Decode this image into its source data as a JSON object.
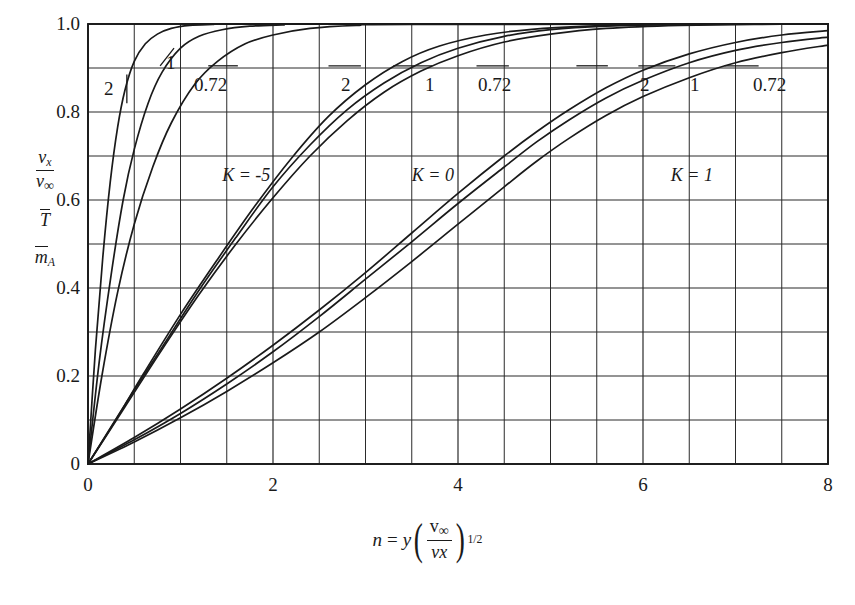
{
  "chart_data": {
    "type": "line",
    "title": "",
    "xlabel": "n = y ( v∞ / vx )^(1/2)",
    "ylabel": "vx/v∞ , T̄ , m̄_A",
    "xlim": [
      0,
      8
    ],
    "ylim": [
      0,
      1.0
    ],
    "xticks": [
      0,
      2,
      4,
      6,
      8
    ],
    "yticks": [
      0,
      0.2,
      0.4,
      0.6,
      0.8,
      1.0
    ],
    "xtick_labels": [
      "0",
      "2",
      "4",
      "6",
      "8"
    ],
    "ytick_labels": [
      "0",
      "0.2",
      "0.4",
      "0.6",
      "0.8",
      "1.0"
    ],
    "x_minor_step": 0.5,
    "y_minor_step": 0.1,
    "grid": true,
    "legend_position": "inline-annotations",
    "groups": [
      {
        "name": "K = -5",
        "K": -5,
        "label_x": 1.45,
        "label_y": 0.655,
        "series": [
          {
            "name": "2",
            "Pr": 2,
            "label": "2",
            "label_px_x": 104,
            "label_px_y": 78,
            "leader": {
              "x1": 0.42,
              "y1": 0.885,
              "x2": 0.42,
              "y2": 0.82
            },
            "points": [
              [
                0,
                0
              ],
              [
                0.08,
                0.26
              ],
              [
                0.16,
                0.47
              ],
              [
                0.24,
                0.64
              ],
              [
                0.32,
                0.765
              ],
              [
                0.4,
                0.85
              ],
              [
                0.5,
                0.915
              ],
              [
                0.62,
                0.955
              ],
              [
                0.75,
                0.977
              ],
              [
                0.9,
                0.99
              ],
              [
                1.1,
                0.997
              ],
              [
                1.35,
                0.999
              ],
              [
                1.7,
                1.0
              ],
              [
                8,
                1.0
              ]
            ]
          },
          {
            "name": "1",
            "Pr": 1,
            "label": "1",
            "label_px_x": 166,
            "label_px_y": 52,
            "leader": {
              "x1": 0.93,
              "y1": 0.945,
              "x2": 0.78,
              "y2": 0.905
            },
            "points": [
              [
                0,
                0
              ],
              [
                0.12,
                0.23
              ],
              [
                0.25,
                0.43
              ],
              [
                0.38,
                0.6
              ],
              [
                0.5,
                0.715
              ],
              [
                0.65,
                0.82
              ],
              [
                0.8,
                0.89
              ],
              [
                1.0,
                0.945
              ],
              [
                1.2,
                0.972
              ],
              [
                1.45,
                0.987
              ],
              [
                1.75,
                0.995
              ],
              [
                2.1,
                0.998
              ],
              [
                2.6,
                1.0
              ],
              [
                8,
                1.0
              ]
            ]
          },
          {
            "name": "0.72",
            "Pr": 0.72,
            "label": "0.72",
            "label_px_x": 194,
            "label_px_y": 74,
            "leader": {
              "x1": 1.3,
              "y1": 0.905,
              "x2": 1.62,
              "y2": 0.905
            },
            "points": [
              [
                0,
                0
              ],
              [
                0.15,
                0.2
              ],
              [
                0.32,
                0.39
              ],
              [
                0.5,
                0.545
              ],
              [
                0.7,
                0.675
              ],
              [
                0.9,
                0.775
              ],
              [
                1.15,
                0.862
              ],
              [
                1.4,
                0.915
              ],
              [
                1.7,
                0.955
              ],
              [
                2.0,
                0.975
              ],
              [
                2.4,
                0.99
              ],
              [
                2.9,
                0.997
              ],
              [
                3.5,
                0.999
              ],
              [
                8,
                1.0
              ]
            ]
          }
        ]
      },
      {
        "name": "K = 0",
        "K": 0,
        "label_x": 3.5,
        "label_y": 0.655,
        "series": [
          {
            "name": "2",
            "Pr": 2,
            "label": "2",
            "label_px_x": 341,
            "label_px_y": 74,
            "leader": {
              "x1": 2.6,
              "y1": 0.905,
              "x2": 2.95,
              "y2": 0.905
            },
            "points": [
              [
                0,
                0
              ],
              [
                0.3,
                0.1
              ],
              [
                0.6,
                0.205
              ],
              [
                1.0,
                0.34
              ],
              [
                1.4,
                0.465
              ],
              [
                1.8,
                0.585
              ],
              [
                2.2,
                0.695
              ],
              [
                2.6,
                0.79
              ],
              [
                3.0,
                0.862
              ],
              [
                3.4,
                0.915
              ],
              [
                3.8,
                0.95
              ],
              [
                4.3,
                0.975
              ],
              [
                4.8,
                0.988
              ],
              [
                5.4,
                0.995
              ],
              [
                6.2,
                0.999
              ],
              [
                7.0,
                1.0
              ],
              [
                8,
                1.0
              ]
            ]
          },
          {
            "name": "1",
            "Pr": 1,
            "label": "1",
            "label_px_x": 425,
            "label_px_y": 74,
            "leader": {
              "x1": 3.3,
              "y1": 0.905,
              "x2": 3.72,
              "y2": 0.905
            },
            "points": [
              [
                0,
                0
              ],
              [
                0.4,
                0.135
              ],
              [
                0.8,
                0.265
              ],
              [
                1.2,
                0.395
              ],
              [
                1.6,
                0.515
              ],
              [
                2.0,
                0.63
              ],
              [
                2.4,
                0.725
              ],
              [
                2.8,
                0.805
              ],
              [
                3.2,
                0.866
              ],
              [
                3.6,
                0.912
              ],
              [
                4.0,
                0.945
              ],
              [
                4.5,
                0.972
              ],
              [
                5.0,
                0.987
              ],
              [
                5.6,
                0.995
              ],
              [
                6.4,
                0.999
              ],
              [
                7.2,
                1.0
              ],
              [
                8,
                1.0
              ]
            ]
          },
          {
            "name": "0.72",
            "Pr": 0.72,
            "label": "0.72",
            "label_px_x": 478,
            "label_px_y": 74,
            "leader": {
              "x1": 4.2,
              "y1": 0.905,
              "x2": 4.55,
              "y2": 0.905
            },
            "points": [
              [
                0,
                0
              ],
              [
                0.4,
                0.13
              ],
              [
                0.8,
                0.26
              ],
              [
                1.2,
                0.385
              ],
              [
                1.6,
                0.5
              ],
              [
                2.0,
                0.605
              ],
              [
                2.4,
                0.7
              ],
              [
                2.8,
                0.78
              ],
              [
                3.2,
                0.845
              ],
              [
                3.6,
                0.893
              ],
              [
                4.0,
                0.928
              ],
              [
                4.5,
                0.959
              ],
              [
                5.0,
                0.977
              ],
              [
                5.6,
                0.99
              ],
              [
                6.4,
                0.997
              ],
              [
                7.2,
                0.999
              ],
              [
                8,
                1.0
              ]
            ]
          }
        ]
      },
      {
        "name": "K = 1",
        "K": 1,
        "label_x": 6.3,
        "label_y": 0.655,
        "series": [
          {
            "name": "2",
            "Pr": 2,
            "label": "2",
            "label_px_x": 640,
            "label_px_y": 74,
            "leader": {
              "x1": 5.28,
              "y1": 0.905,
              "x2": 5.62,
              "y2": 0.905
            },
            "points": [
              [
                0,
                0
              ],
              [
                0.5,
                0.06
              ],
              [
                1.0,
                0.125
              ],
              [
                1.5,
                0.195
              ],
              [
                2.0,
                0.27
              ],
              [
                2.5,
                0.35
              ],
              [
                3.0,
                0.435
              ],
              [
                3.5,
                0.525
              ],
              [
                4.0,
                0.615
              ],
              [
                4.5,
                0.7
              ],
              [
                4.85,
                0.755
              ],
              [
                5.2,
                0.805
              ],
              [
                5.6,
                0.855
              ],
              [
                6.0,
                0.895
              ],
              [
                6.5,
                0.932
              ],
              [
                7.0,
                0.958
              ],
              [
                7.5,
                0.975
              ],
              [
                8,
                0.985
              ]
            ]
          },
          {
            "name": "1",
            "Pr": 1,
            "label": "1",
            "label_px_x": 690,
            "label_px_y": 74,
            "leader": {
              "x1": 5.95,
              "y1": 0.905,
              "x2": 6.35,
              "y2": 0.905
            },
            "points": [
              [
                0,
                0
              ],
              [
                0.5,
                0.055
              ],
              [
                1.0,
                0.115
              ],
              [
                1.5,
                0.182
              ],
              [
                2.0,
                0.255
              ],
              [
                2.5,
                0.335
              ],
              [
                3.0,
                0.42
              ],
              [
                3.5,
                0.505
              ],
              [
                4.0,
                0.592
              ],
              [
                4.5,
                0.675
              ],
              [
                4.85,
                0.732
              ],
              [
                5.2,
                0.782
              ],
              [
                5.6,
                0.832
              ],
              [
                6.0,
                0.872
              ],
              [
                6.5,
                0.912
              ],
              [
                7.0,
                0.94
              ],
              [
                7.5,
                0.958
              ],
              [
                8,
                0.97
              ]
            ]
          },
          {
            "name": "0.72",
            "Pr": 0.72,
            "label": "0.72",
            "label_px_x": 753,
            "label_px_y": 74,
            "leader": {
              "x1": 6.88,
              "y1": 0.905,
              "x2": 7.25,
              "y2": 0.905
            },
            "points": [
              [
                0,
                0
              ],
              [
                0.5,
                0.05
              ],
              [
                1.0,
                0.105
              ],
              [
                1.5,
                0.165
              ],
              [
                2.0,
                0.23
              ],
              [
                2.5,
                0.3
              ],
              [
                3.0,
                0.378
              ],
              [
                3.5,
                0.46
              ],
              [
                4.0,
                0.545
              ],
              [
                4.5,
                0.63
              ],
              [
                4.85,
                0.688
              ],
              [
                5.2,
                0.74
              ],
              [
                5.6,
                0.792
              ],
              [
                6.0,
                0.835
              ],
              [
                6.5,
                0.878
              ],
              [
                7.0,
                0.912
              ],
              [
                7.5,
                0.935
              ],
              [
                8,
                0.952
              ]
            ]
          }
        ]
      }
    ]
  },
  "axes": {
    "x": {
      "labels": [
        "0",
        "2",
        "4",
        "6",
        "8"
      ],
      "title_parts": {
        "n": "n",
        "eq": "=",
        "y": "y",
        "num": "v",
        "num_sub": "∞",
        "den": "vx",
        "exp": "1/2"
      }
    },
    "y": {
      "labels": [
        "0",
        "0.2",
        "0.4",
        "0.6",
        "0.8",
        "1.0"
      ],
      "stack": {
        "velocity_num": "v",
        "velocity_num_sub": "x",
        "velocity_den": "v",
        "velocity_den_sub": "∞",
        "temperature": "T",
        "mass_fraction": "m",
        "mass_fraction_sub": "A"
      }
    }
  },
  "style": {
    "line_color": "#1a1a1a",
    "grid_color": "#2b2b2b",
    "background": "#ffffff"
  }
}
